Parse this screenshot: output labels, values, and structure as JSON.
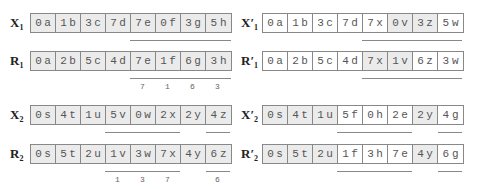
{
  "panels": [
    {
      "id": "top-left",
      "rows": [
        {
          "label_main": "X",
          "label_prime": "",
          "label_sub": "1",
          "cells": [
            [
              "0",
              "a",
              "gray"
            ],
            [
              "1",
              "b",
              "gray"
            ],
            [
              "3",
              "c",
              "gray"
            ],
            [
              "7",
              "d",
              "gray"
            ],
            [
              "7",
              "e",
              "gray"
            ],
            [
              "0",
              "f",
              "gray"
            ],
            [
              "3",
              "g",
              "gray"
            ],
            [
              "5",
              "h",
              "gray"
            ]
          ]
        },
        {
          "label_main": "R",
          "label_prime": "",
          "label_sub": "1",
          "cells": [
            [
              "0",
              "a",
              "gray"
            ],
            [
              "2",
              "b",
              "gray"
            ],
            [
              "5",
              "c",
              "gray"
            ],
            [
              "4",
              "d",
              "gray"
            ],
            [
              "7",
              "e",
              "gray"
            ],
            [
              "1",
              "f",
              "gray"
            ],
            [
              "6",
              "g",
              "gray"
            ],
            [
              "3",
              "h",
              "gray"
            ]
          ]
        }
      ],
      "numbers": [
        "7",
        "1",
        "6",
        "3"
      ]
    },
    {
      "id": "top-right",
      "rows": [
        {
          "label_main": "X",
          "label_prime": "′",
          "label_sub": "1",
          "cells": [
            [
              "0",
              "a",
              "white"
            ],
            [
              "1",
              "b",
              "white"
            ],
            [
              "3",
              "c",
              "white"
            ],
            [
              "7",
              "d",
              "white"
            ],
            [
              "7",
              "x",
              "white"
            ],
            [
              "0",
              "v",
              "gray"
            ],
            [
              "3",
              "z",
              "gray"
            ],
            [
              "5",
              "w",
              "white"
            ]
          ]
        },
        {
          "label_main": "R",
          "label_prime": "′",
          "label_sub": "1",
          "cells": [
            [
              "0",
              "a",
              "white"
            ],
            [
              "2",
              "b",
              "white"
            ],
            [
              "5",
              "c",
              "white"
            ],
            [
              "4",
              "d",
              "white"
            ],
            [
              "7",
              "x",
              "gray"
            ],
            [
              "1",
              "v",
              "gray"
            ],
            [
              "6",
              "z",
              "white"
            ],
            [
              "3",
              "w",
              "white"
            ]
          ]
        }
      ],
      "numbers": []
    },
    {
      "id": "bottom-left",
      "rows": [
        {
          "label_main": "X",
          "label_prime": "",
          "label_sub": "2",
          "cells": [
            [
              "0",
              "s",
              "gray"
            ],
            [
              "4",
              "t",
              "gray"
            ],
            [
              "1",
              "u",
              "gray"
            ],
            [
              "5",
              "v",
              "gray"
            ],
            [
              "0",
              "w",
              "gray"
            ],
            [
              "2",
              "x",
              "gray"
            ],
            [
              "2",
              "y",
              "gray"
            ],
            [
              "4",
              "z",
              "gray"
            ]
          ]
        },
        {
          "label_main": "R",
          "label_prime": "",
          "label_sub": "2",
          "cells": [
            [
              "0",
              "s",
              "gray"
            ],
            [
              "5",
              "t",
              "gray"
            ],
            [
              "2",
              "u",
              "gray"
            ],
            [
              "1",
              "v",
              "gray"
            ],
            [
              "3",
              "w",
              "gray"
            ],
            [
              "7",
              "x",
              "gray"
            ],
            [
              "4",
              "y",
              "gray"
            ],
            [
              "6",
              "z",
              "gray"
            ]
          ]
        }
      ],
      "numbers": [
        "1",
        "3",
        "7",
        "",
        "6"
      ]
    },
    {
      "id": "bottom-right",
      "rows": [
        {
          "label_main": "X",
          "label_prime": "′",
          "label_sub": "2",
          "cells": [
            [
              "0",
              "s",
              "gray"
            ],
            [
              "4",
              "t",
              "gray"
            ],
            [
              "1",
              "u",
              "gray"
            ],
            [
              "5",
              "f",
              "white"
            ],
            [
              "0",
              "h",
              "white"
            ],
            [
              "2",
              "e",
              "white"
            ],
            [
              "2",
              "y",
              "gray"
            ],
            [
              "4",
              "g",
              "white"
            ]
          ]
        },
        {
          "label_main": "R",
          "label_prime": "′",
          "label_sub": "2",
          "cells": [
            [
              "0",
              "s",
              "gray"
            ],
            [
              "5",
              "t",
              "gray"
            ],
            [
              "2",
              "u",
              "gray"
            ],
            [
              "1",
              "f",
              "white"
            ],
            [
              "3",
              "h",
              "white"
            ],
            [
              "7",
              "e",
              "white"
            ],
            [
              "4",
              "y",
              "gray"
            ],
            [
              "6",
              "g",
              "white"
            ]
          ]
        }
      ],
      "numbers": []
    }
  ]
}
